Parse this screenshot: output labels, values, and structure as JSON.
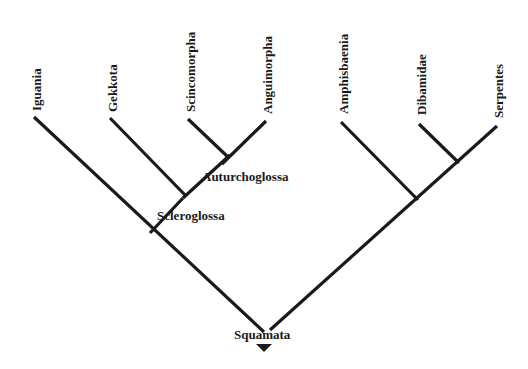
{
  "diagram": {
    "type": "cladogram",
    "root": "Squamata",
    "taxa": [
      {
        "id": "iguania",
        "label": "Iguania"
      },
      {
        "id": "gekkota",
        "label": "Gekkota"
      },
      {
        "id": "scincomorpha",
        "label": "Scincomorpha"
      },
      {
        "id": "anguimorpha",
        "label": "Anguimorpha"
      },
      {
        "id": "amphisbaenia",
        "label": "Amphisbaenia"
      },
      {
        "id": "dibamidae",
        "label": "Dibamidae"
      },
      {
        "id": "serpentes",
        "label": "Serpentes"
      }
    ],
    "clades": {
      "squamata": "Squamata",
      "scleroglossa": "Scleroglossa",
      "autarchoglossa": "Auturchoglossa"
    },
    "line_color": "#1a1a1a",
    "background": "#ffffff"
  }
}
